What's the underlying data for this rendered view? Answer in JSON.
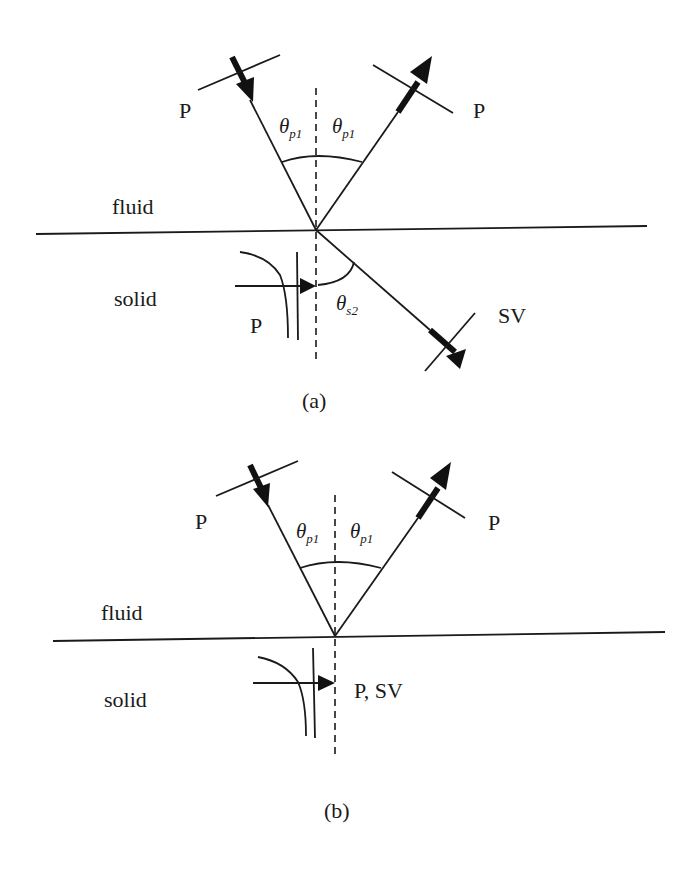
{
  "figure": {
    "panels": [
      {
        "id": "a",
        "caption": "(a)",
        "media": {
          "upper": "fluid",
          "lower": "solid"
        },
        "incident_wave": {
          "label": "P",
          "angle_label": "θ",
          "angle_sub": "p1"
        },
        "reflected_wave": {
          "label": "P",
          "angle_label": "θ",
          "angle_sub": "p1"
        },
        "transmitted_wave": {
          "label": "SV",
          "angle_label": "θ",
          "angle_sub": "s2"
        },
        "evanescent_wave": {
          "label": "P"
        }
      },
      {
        "id": "b",
        "caption": "(b)",
        "media": {
          "upper": "fluid",
          "lower": "solid"
        },
        "incident_wave": {
          "label": "P",
          "angle_label": "θ",
          "angle_sub": "p1"
        },
        "reflected_wave": {
          "label": "P",
          "angle_label": "θ",
          "angle_sub": "p1"
        },
        "evanescent_wave": {
          "label": "P, SV"
        }
      }
    ],
    "colors": {
      "line": "#1a1a1a",
      "background": "#ffffff"
    }
  }
}
